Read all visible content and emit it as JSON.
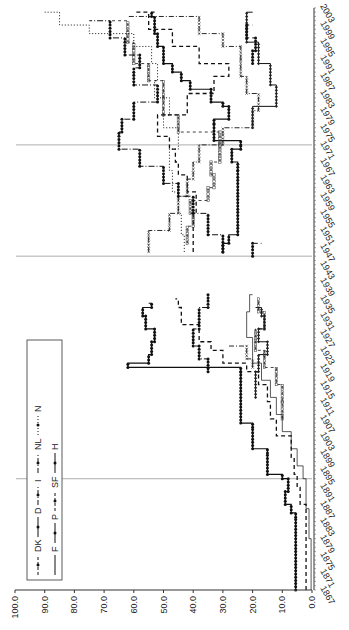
{
  "chart_data": {
    "type": "line",
    "title": "",
    "xlabel": "",
    "ylabel": "",
    "orientation": "rotated-90-clockwise",
    "ylim": [
      0,
      100
    ],
    "y_ticks": [
      "0.0",
      "10.0",
      "20.0",
      "30.0",
      "40.0",
      "50.0",
      "60.0",
      "70.0",
      "80.0",
      "90.0",
      "100.0"
    ],
    "x_range": [
      1867,
      2003
    ],
    "x_ticks": [
      "1867",
      "1871",
      "1875",
      "1879",
      "1883",
      "1887",
      "1891",
      "1895",
      "1899",
      "1903",
      "1907",
      "1911",
      "1915",
      "1919",
      "1923",
      "1927",
      "1931",
      "1935",
      "1939",
      "1943",
      "1947",
      "1951",
      "1955",
      "1959",
      "1963",
      "1967",
      "1971",
      "1975",
      "1979",
      "1983",
      "1987",
      "1991",
      "1995",
      "1999",
      "2003"
    ],
    "reference_lines": [
      1893,
      1945,
      1971
    ],
    "grid": false,
    "legend_position": "inside-left (rotated top-left)",
    "legend": [
      {
        "name": "DK",
        "style": "dashed-square"
      },
      {
        "name": "D",
        "style": "solid-filled-dot"
      },
      {
        "name": "I",
        "style": "dash-dot-x"
      },
      {
        "name": "NL",
        "style": "dash-dot-filled"
      },
      {
        "name": "N",
        "style": "dotted"
      },
      {
        "name": "F",
        "style": "solid-thin"
      },
      {
        "name": "P",
        "style": "solid-diamond"
      },
      {
        "name": "SF",
        "style": "dashed-open-diamond"
      },
      {
        "name": "H",
        "style": "dash-filled-dot"
      }
    ],
    "series": [
      {
        "name": "D",
        "dash": "",
        "width": 1.2,
        "marker": "dot",
        "points": [
          [
            1867,
            5.5
          ],
          [
            1884,
            5.5
          ],
          [
            1885,
            7
          ],
          [
            1887,
            9
          ],
          [
            1890,
            8
          ],
          [
            1893,
            10
          ],
          [
            1894,
            15
          ],
          [
            1899,
            15
          ],
          [
            1900,
            20
          ],
          [
            1905,
            20
          ],
          [
            1906,
            24
          ],
          [
            1918,
            24
          ],
          [
            1919,
            62
          ],
          [
            1920,
            55
          ],
          [
            1922,
            54
          ],
          [
            1925,
            53
          ],
          [
            1928,
            56
          ],
          [
            1931,
            57
          ],
          [
            1933,
            54
          ],
          [
            1934,
            55
          ],
          [
            null,
            null
          ],
          [
            1946,
            30
          ],
          [
            1948,
            28
          ],
          [
            1950,
            25
          ],
          [
            1965,
            25
          ],
          [
            1967,
            27
          ],
          [
            1970,
            24
          ],
          [
            1971,
            24
          ],
          [
            1972,
            33
          ],
          [
            1976,
            33
          ],
          [
            1977,
            28
          ],
          [
            1980,
            30
          ],
          [
            1981,
            34
          ],
          [
            1984,
            41
          ],
          [
            1986,
            44
          ],
          [
            1988,
            47
          ],
          [
            1990,
            50
          ],
          [
            1994,
            52
          ],
          [
            1997,
            53
          ],
          [
            2001,
            54
          ],
          [
            2002,
            53
          ]
        ]
      },
      {
        "name": "DK",
        "dash": "4,3",
        "width": 1.3,
        "marker": "none",
        "points": [
          [
            1867,
            2
          ],
          [
            1883,
            2
          ],
          [
            1887,
            4
          ],
          [
            1891,
            5
          ],
          [
            1894,
            6
          ],
          [
            1898,
            7
          ],
          [
            1903,
            12
          ],
          [
            1907,
            14
          ],
          [
            1911,
            15
          ],
          [
            1915,
            18
          ],
          [
            1918,
            22
          ],
          [
            1920,
            30
          ],
          [
            1923,
            34
          ],
          [
            1925,
            38
          ],
          [
            1929,
            44
          ],
          [
            1933,
            45
          ],
          [
            1935,
            46
          ],
          [
            null,
            null
          ],
          [
            1946,
            40
          ],
          [
            1950,
            40
          ],
          [
            1955,
            39
          ],
          [
            1960,
            42
          ],
          [
            1964,
            45
          ],
          [
            1967,
            46
          ],
          [
            1970,
            48
          ],
          [
            1973,
            52
          ],
          [
            1978,
            42
          ],
          [
            1983,
            33
          ],
          [
            1987,
            28
          ],
          [
            1990,
            38
          ],
          [
            1994,
            47
          ],
          [
            1998,
            55
          ],
          [
            2002,
            60
          ]
        ]
      },
      {
        "name": "F",
        "dash": "",
        "width": 0.7,
        "marker": "none",
        "points": [
          [
            1867,
            0.3
          ],
          [
            1878,
            0.3
          ],
          [
            1879,
            1
          ],
          [
            1883,
            1
          ],
          [
            1886,
            2
          ],
          [
            1890,
            2
          ],
          [
            1893,
            3
          ],
          [
            1896,
            5
          ],
          [
            1900,
            7
          ],
          [
            1904,
            10
          ],
          [
            1908,
            12
          ],
          [
            1912,
            14
          ],
          [
            1916,
            17
          ],
          [
            1920,
            20
          ],
          [
            1926,
            22
          ],
          [
            1932,
            21
          ],
          [
            1936,
            20
          ]
        ]
      },
      {
        "name": "P",
        "dash": "",
        "width": 1,
        "marker": "diamond",
        "points": [
          [
            1912,
            19
          ],
          [
            1918,
            18
          ],
          [
            1922,
            15
          ],
          [
            1925,
            18
          ],
          [
            1928,
            16
          ],
          [
            1931,
            17
          ],
          [
            1933,
            19
          ],
          [
            null,
            null
          ],
          [
            1975,
            20
          ],
          [
            1980,
            12
          ],
          [
            1985,
            14
          ],
          [
            1990,
            18
          ],
          [
            1995,
            22
          ],
          [
            2002,
            20
          ]
        ]
      },
      {
        "name": "SF",
        "dash": "3,3",
        "width": 0.8,
        "marker": "square",
        "points": [
          [
            1907,
            10
          ],
          [
            1911,
            10
          ],
          [
            1915,
            12
          ],
          [
            1919,
            16
          ],
          [
            1923,
            19
          ],
          [
            1928,
            16
          ],
          [
            1932,
            18
          ],
          [
            1935,
            18
          ],
          [
            null,
            null
          ],
          [
            1948,
            42
          ],
          [
            1952,
            40
          ],
          [
            1955,
            41
          ],
          [
            1958,
            35
          ],
          [
            1961,
            33
          ],
          [
            1964,
            34
          ],
          [
            1967,
            31
          ],
          [
            1971,
            31
          ],
          [
            1974,
            45
          ],
          [
            1978,
            50
          ],
          [
            1982,
            50
          ],
          [
            1986,
            55
          ],
          [
            1990,
            60
          ],
          [
            1995,
            62
          ],
          [
            2000,
            68
          ]
        ]
      },
      {
        "name": "I",
        "dash": "5,2,1,2",
        "width": 0.9,
        "marker": "x",
        "points": [
          [
            1919,
            20
          ],
          [
            1921,
            22
          ],
          [
            1924,
            28
          ],
          [
            null,
            null
          ],
          [
            1946,
            55
          ],
          [
            1951,
            48
          ],
          [
            1955,
            45
          ],
          [
            1959,
            42
          ],
          [
            1963,
            40
          ],
          [
            1967,
            38
          ],
          [
            1971,
            30
          ],
          [
            1975,
            20
          ],
          [
            1979,
            18
          ],
          [
            1983,
            22
          ],
          [
            1987,
            24
          ],
          [
            1991,
            24
          ],
          [
            1994,
            30
          ],
          [
            1997,
            38
          ],
          [
            2001,
            62
          ]
        ]
      },
      {
        "name": "NL",
        "dash": "6,2,1,2",
        "width": 1,
        "marker": "dot",
        "points": [
          [
            1918,
            35
          ],
          [
            1921,
            38
          ],
          [
            1924,
            40
          ],
          [
            1928,
            38
          ],
          [
            1933,
            35
          ],
          [
            1936,
            36
          ],
          [
            null,
            null
          ],
          [
            1946,
            30
          ],
          [
            1950,
            35
          ],
          [
            1955,
            40
          ],
          [
            1959,
            45
          ],
          [
            1962,
            50
          ],
          [
            1966,
            58
          ],
          [
            1970,
            65
          ],
          [
            1974,
            64
          ],
          [
            1977,
            60
          ],
          [
            1981,
            52
          ],
          [
            1985,
            60
          ],
          [
            1989,
            58
          ],
          [
            1992,
            63
          ],
          [
            1996,
            68
          ],
          [
            2000,
            75
          ]
        ]
      },
      {
        "name": "N",
        "dash": "1,2",
        "width": 1,
        "marker": "none",
        "points": [
          [
            1946,
            43
          ],
          [
            1950,
            44
          ],
          [
            1955,
            45
          ],
          [
            1960,
            47
          ],
          [
            1965,
            48
          ],
          [
            1970,
            45
          ],
          [
            1975,
            50
          ],
          [
            1978,
            48
          ],
          [
            1982,
            53
          ],
          [
            1986,
            52
          ],
          [
            1990,
            54
          ],
          [
            1994,
            60
          ],
          [
            1997,
            75
          ],
          [
            1999,
            85
          ],
          [
            2002,
            90
          ]
        ]
      },
      {
        "name": "H",
        "dash": "4,3",
        "width": 1,
        "marker": "dot",
        "points": [
          [
            1945,
            20
          ],
          [
            1948,
            17
          ],
          [
            null,
            null
          ],
          [
            1990,
            20
          ],
          [
            1993,
            19
          ],
          [
            1996,
            22
          ],
          [
            1999,
            20
          ]
        ]
      }
    ]
  },
  "axes": {
    "value_axis_labels": [
      "0.0",
      "10.0",
      "20.0",
      "30.0",
      "40.0",
      "50.0",
      "60.0",
      "70.0",
      "80.0",
      "90.0",
      "100.0"
    ]
  },
  "legend": {
    "row1": [
      "DK",
      "D",
      "I",
      "NL",
      "N"
    ],
    "row2": [
      "F",
      "P",
      "SF",
      "H"
    ]
  }
}
